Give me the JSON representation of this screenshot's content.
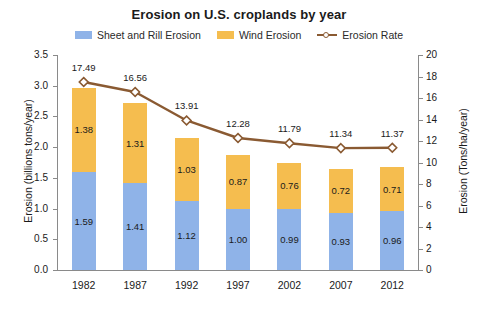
{
  "title": "Erosion on U.S. croplands by year",
  "legend": {
    "items": [
      {
        "label": "Sheet and Rill Erosion",
        "type": "swatch",
        "color": "#8FB3E8"
      },
      {
        "label": "Wind Erosion",
        "type": "swatch",
        "color": "#F5BD4F"
      },
      {
        "label": "Erosion Rate",
        "type": "line",
        "color": "#8A5A32"
      }
    ]
  },
  "axes": {
    "left": {
      "title": "Erosion (billions tons/year)",
      "ticks": [
        "0.0",
        "0.5",
        "1.0",
        "1.5",
        "2.0",
        "2.5",
        "3.0",
        "3.5"
      ],
      "min": 0,
      "max": 3.5
    },
    "right": {
      "title": "Erosion (Tons/ha/year)",
      "ticks": [
        "0",
        "2",
        "4",
        "6",
        "8",
        "10",
        "12",
        "14",
        "16",
        "18",
        "20"
      ],
      "min": 0,
      "max": 20
    },
    "x": {
      "title": "",
      "categories": [
        "1982",
        "1987",
        "1992",
        "1997",
        "2002",
        "2007",
        "2012"
      ]
    }
  },
  "bottom_artifact": " ",
  "chart_data": {
    "type": "bar",
    "title": "Erosion on U.S. croplands by year",
    "xlabel": "",
    "ylabel": "Erosion (billions tons/year)",
    "y2label": "Erosion (Tons/ha/year)",
    "ylim": [
      0,
      3.5
    ],
    "y2lim": [
      0,
      20
    ],
    "grid": false,
    "legend_position": "top-center",
    "stacked": true,
    "categories": [
      "1982",
      "1987",
      "1992",
      "1997",
      "2002",
      "2007",
      "2012"
    ],
    "series": [
      {
        "name": "Sheet and Rill Erosion",
        "type": "bar",
        "axis": "left",
        "color": "#8FB3E8",
        "values": [
          1.59,
          1.41,
          1.12,
          1.0,
          0.99,
          0.93,
          0.96
        ],
        "labels": [
          "1.59",
          "1.41",
          "1.12",
          "1.00",
          "0.99",
          "0.93",
          "0.96"
        ]
      },
      {
        "name": "Wind Erosion",
        "type": "bar",
        "axis": "left",
        "color": "#F5BD4F",
        "values": [
          1.38,
          1.31,
          1.03,
          0.87,
          0.76,
          0.72,
          0.71
        ],
        "labels": [
          "1.38",
          "1.31",
          "1.03",
          "0.87",
          "0.76",
          "0.72",
          "0.71"
        ]
      },
      {
        "name": "Erosion Rate",
        "type": "line",
        "axis": "right",
        "color": "#8A5A32",
        "marker": "diamond",
        "values": [
          17.49,
          16.56,
          13.91,
          12.28,
          11.79,
          11.34,
          11.37
        ],
        "labels": [
          "17.49",
          "16.56",
          "13.91",
          "12.28",
          "11.79",
          "11.34",
          "11.37"
        ]
      }
    ]
  }
}
